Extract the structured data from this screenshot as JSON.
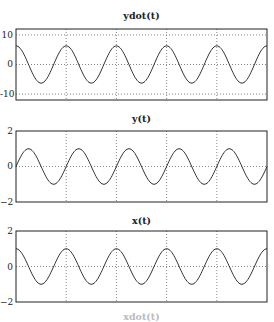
{
  "chart_data": [
    {
      "type": "line",
      "title": "ydot(t)",
      "xlabel": "",
      "ylabel": "",
      "ylim": [
        -12,
        12
      ],
      "yticks": [
        "10",
        "0",
        "-10"
      ],
      "ytick_values": [
        10,
        0,
        -10
      ],
      "grid": true,
      "periods_shown": 5,
      "series": [
        {
          "name": "ydot(t)",
          "form": "cosine",
          "amplitude": 6.3,
          "offset": 0,
          "phase_start": "max"
        }
      ]
    },
    {
      "type": "line",
      "title": "y(t)",
      "xlabel": "",
      "ylabel": "",
      "ylim": [
        -2,
        2
      ],
      "yticks": [
        "2",
        "0",
        "−2"
      ],
      "ytick_values": [
        2,
        0,
        -2
      ],
      "grid": true,
      "periods_shown": 5,
      "series": [
        {
          "name": "y(t)",
          "form": "sine",
          "amplitude": 1,
          "offset": 0,
          "phase_start": "zero-rising"
        }
      ]
    },
    {
      "type": "line",
      "title": "x(t)",
      "xlabel": "",
      "ylabel": "",
      "ylim": [
        -2,
        2
      ],
      "yticks": [
        "2",
        "0",
        "−2"
      ],
      "ytick_values": [
        2,
        0,
        -2
      ],
      "grid": true,
      "periods_shown": 5,
      "series": [
        {
          "name": "x(t)",
          "form": "cosine",
          "amplitude": 1,
          "offset": 0,
          "phase_start": "max"
        }
      ]
    }
  ],
  "panels": [
    {
      "title": "ydot(t)",
      "ticks": [
        "10",
        "0",
        "-10"
      ]
    },
    {
      "title": "y(t)",
      "ticks": [
        "2",
        "0",
        "−2"
      ]
    },
    {
      "title": "x(t)",
      "ticks": [
        "2",
        "0",
        "−2"
      ]
    }
  ],
  "bottom_partial_title": "xdot(t)",
  "colors": {
    "line": "#333333",
    "grid": "#555555",
    "frame": "#222222"
  }
}
